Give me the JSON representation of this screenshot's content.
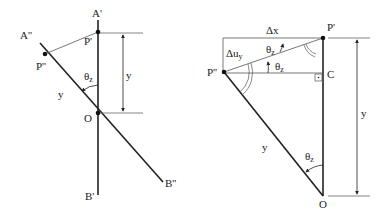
{
  "left_figure": {
    "labels": {
      "A_prime": "A'",
      "A_double_prime": "A''",
      "P_prime": "P'",
      "P_double_prime": "P''",
      "O": "O",
      "B_prime": "B'",
      "B_double_prime": "B''",
      "y_dimension": "y",
      "y_radius": "y",
      "theta": "θ",
      "theta_sub": "z"
    }
  },
  "right_figure": {
    "labels": {
      "P_prime": "P'",
      "P_double_prime": "P''",
      "C": "C",
      "O": "O",
      "delta_x": "Δx",
      "delta_u": "Δu",
      "delta_u_sub": "y",
      "y_dimension": "y",
      "y_radius": "y",
      "theta": "θ",
      "theta_sub": "z"
    }
  }
}
